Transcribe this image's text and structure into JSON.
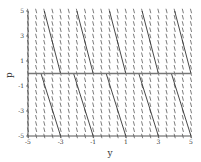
{
  "chart_data": {
    "type": "line",
    "subtype": "direction-field",
    "title": "",
    "xlabel": "y",
    "ylabel": "p",
    "xlim": [
      -5,
      5
    ],
    "ylim": [
      -5,
      5
    ],
    "xticks": [
      -5,
      -3,
      -1,
      1,
      3,
      5
    ],
    "yticks": [
      -5,
      -3,
      -1,
      1,
      3,
      5
    ],
    "grid": false,
    "legend": null,
    "colors": {
      "axis": "#555555",
      "field": "#444444",
      "curve": "#333333",
      "zero_line": "#777777"
    },
    "equilibrium_line": {
      "p": 0
    },
    "field_slope_dy_dp": -0.2,
    "series": [
      {
        "name": "upper-1",
        "points": [
          [
            -4.0,
            5
          ],
          [
            -3.0,
            0
          ]
        ]
      },
      {
        "name": "upper-2",
        "points": [
          [
            -2.0,
            5
          ],
          [
            -1.0,
            0
          ]
        ]
      },
      {
        "name": "upper-3",
        "points": [
          [
            0.0,
            5
          ],
          [
            1.0,
            0
          ]
        ]
      },
      {
        "name": "upper-4",
        "points": [
          [
            2.0,
            5
          ],
          [
            3.0,
            0
          ]
        ]
      },
      {
        "name": "upper-5",
        "points": [
          [
            4.0,
            5
          ],
          [
            5.0,
            0
          ]
        ]
      },
      {
        "name": "lower-1",
        "points": [
          [
            -4.2,
            0
          ],
          [
            -3.0,
            -5
          ]
        ]
      },
      {
        "name": "lower-2",
        "points": [
          [
            -2.2,
            0
          ],
          [
            -1.0,
            -5
          ]
        ]
      },
      {
        "name": "lower-3",
        "points": [
          [
            -0.2,
            0
          ],
          [
            1.0,
            -5
          ]
        ]
      },
      {
        "name": "lower-4",
        "points": [
          [
            1.8,
            0
          ],
          [
            3.0,
            -5
          ]
        ]
      },
      {
        "name": "lower-5",
        "points": [
          [
            3.8,
            0
          ],
          [
            5.0,
            -5
          ]
        ]
      }
    ]
  }
}
